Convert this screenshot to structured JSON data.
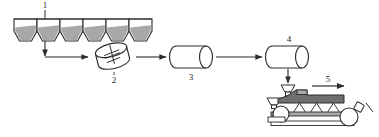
{
  "diagram": {
    "type": "process-flow",
    "background_color": "#ffffff",
    "line_color": "#2b2b2b",
    "fill_light": "#ffffff",
    "fill_mid": "#a8a8a8",
    "fill_dark": "#6e6e6e",
    "labels": {
      "hoppers": "1",
      "mixer": "2",
      "extruder": "3",
      "former": "4",
      "conveyor": "5"
    },
    "stages": [
      {
        "id": "hoppers",
        "label": "1",
        "name": "raw-material-hoppers",
        "count": 6,
        "description": "row of six hoppers holding granular material"
      },
      {
        "id": "mixer",
        "label": "2",
        "name": "tilted-drum-mixer",
        "description": "tilted cylindrical drum mixer with agitator"
      },
      {
        "id": "extruder",
        "label": "3",
        "name": "horizontal-cylinder-extruder",
        "description": "horizontal cylinder vessel"
      },
      {
        "id": "former",
        "label": "4",
        "name": "horizontal-cylinder-former",
        "description": "horizontal cylinder vessel feeding downward"
      },
      {
        "id": "conveyor",
        "label": "5",
        "name": "conveyor-belt-line",
        "description": "conveyor belt with rollers, feed funnels and moulds; product ejected at the end"
      }
    ],
    "connections": [
      {
        "from": "hoppers",
        "to": "mixer",
        "style": "elbow-arrow"
      },
      {
        "from": "mixer",
        "to": "extruder",
        "style": "straight-arrow"
      },
      {
        "from": "extruder",
        "to": "former",
        "style": "straight-arrow"
      },
      {
        "from": "former",
        "to": "conveyor",
        "style": "down-arrow"
      }
    ]
  }
}
